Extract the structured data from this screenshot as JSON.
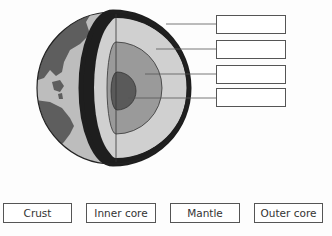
{
  "diagram": {
    "layers": [
      "crust",
      "mantle",
      "outer core",
      "inner core"
    ],
    "colors": {
      "ocean": "#bdbdbd",
      "land": "#5e5e5e",
      "crust_ring": "#1e1e1e",
      "mantle": "#d0d0d0",
      "outer_core": "#9a9a9a",
      "inner_core": "#5a5a5a",
      "outline": "#222222"
    },
    "blank_label_boxes": [
      {
        "value": ""
      },
      {
        "value": ""
      },
      {
        "value": ""
      },
      {
        "value": ""
      }
    ]
  },
  "word_bank": [
    {
      "label": "Crust"
    },
    {
      "label": "Inner core"
    },
    {
      "label": "Mantle"
    },
    {
      "label": "Outer core"
    }
  ]
}
